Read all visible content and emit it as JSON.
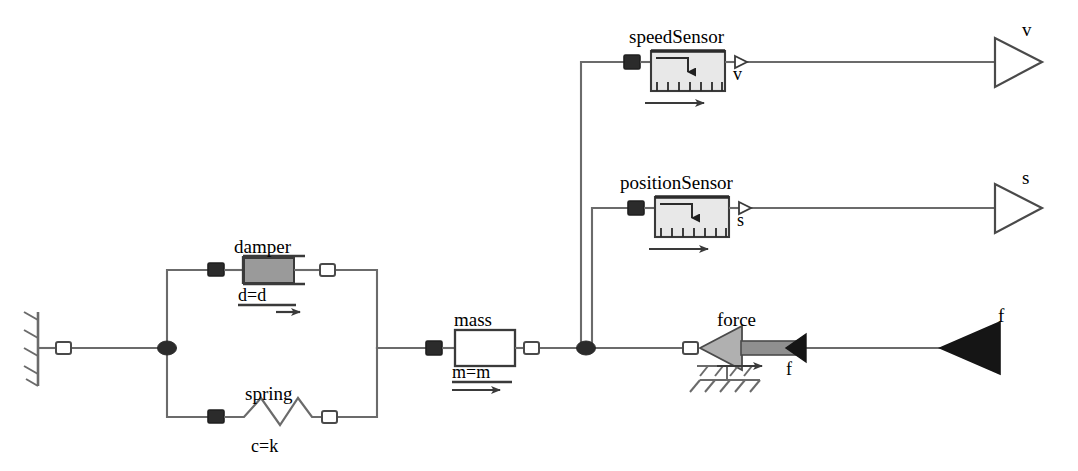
{
  "diagram": {
    "background": "#ffffff",
    "line_color": "#6b6b6b",
    "dark_fill": "#2b2b2b",
    "gray_fill": "#9a9a9a",
    "light_fill": "#e8e8e8",
    "white_fill": "#ffffff",
    "text_color": "#000000"
  },
  "components": {
    "fixed": {
      "name": "fixed-wall-ground",
      "label": ""
    },
    "damper": {
      "label": "damper",
      "parameter": "d=d",
      "icon": "damper-icon"
    },
    "spring": {
      "label": "spring",
      "parameter": "c=k",
      "icon": "spring-icon"
    },
    "mass": {
      "label": "mass",
      "parameter": "m=m",
      "icon": "mass-icon"
    },
    "force": {
      "label": "force",
      "port_label": "f",
      "icon": "force-icon"
    },
    "speed_sensor": {
      "label": "speedSensor",
      "port_label": "v",
      "icon": "speed-sensor-icon"
    },
    "position_sensor": {
      "label": "positionSensor",
      "port_label": "s",
      "icon": "position-sensor-icon"
    }
  },
  "signals": {
    "v_output": "v",
    "s_output": "s",
    "f_input": "f"
  }
}
